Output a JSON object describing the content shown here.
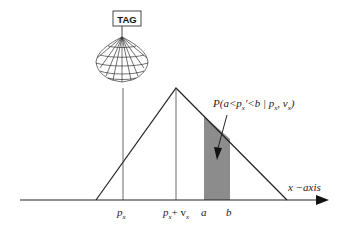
{
  "diagram": {
    "tag_label": "TAG",
    "axis_label": "x −axis",
    "probability_label": "P(a<p",
    "probability_label_parts": {
      "prefix": "P(a<p",
      "sub1": "x",
      "mid": "'<b | p",
      "sub2": "x",
      "comma": ", v",
      "sub3": "x",
      "suffix": ")"
    },
    "ticks": [
      {
        "id": "px",
        "main": "p",
        "sub": "x"
      },
      {
        "id": "px_plus_vx",
        "main": "p",
        "sub": "x",
        "plus": "+ v",
        "sub2": "x"
      },
      {
        "id": "a",
        "main": "a"
      },
      {
        "id": "b",
        "main": "b"
      }
    ],
    "colors": {
      "line": "#222222",
      "shade": "#8c8c8c",
      "background": "#ffffff"
    }
  }
}
